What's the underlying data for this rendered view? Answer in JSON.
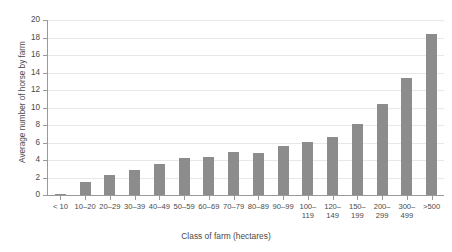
{
  "chart_data": {
    "type": "bar",
    "title": "",
    "xlabel": "Class of farm (hectares)",
    "ylabel": "Average number of horse by farm",
    "categories": [
      "< 10",
      "10–20",
      "20–29",
      "30–39",
      "40–49",
      "50–59",
      "60–69",
      "70–79",
      "80–89",
      "90–99",
      "100–\n119",
      "120–\n149",
      "150–\n199",
      "200–\n299",
      "300–\n499",
      ">500"
    ],
    "values": [
      0.15,
      1.5,
      2.3,
      2.9,
      3.6,
      4.2,
      4.3,
      4.9,
      4.8,
      5.6,
      6.1,
      6.6,
      8.1,
      10.4,
      13.4,
      18.4
    ],
    "ylim": [
      0,
      20
    ],
    "yticks": [
      0,
      2,
      4,
      6,
      8,
      10,
      12,
      14,
      16,
      18,
      20
    ],
    "ytick_labels": [
      "0",
      "2",
      "4",
      "6",
      "8",
      "10",
      "12",
      "14",
      "16",
      "18",
      "20"
    ],
    "grid": true,
    "legend": "none",
    "bar_color": "#8c8c8c",
    "grid_color": "#e8e8e8",
    "axis_color": "#9a9a9a",
    "text_color": "#4a4a4a",
    "background": "#ffffff"
  }
}
